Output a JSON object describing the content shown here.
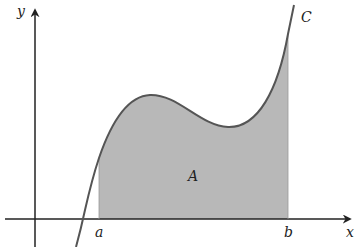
{
  "diagram": {
    "labels": {
      "y_axis": "y",
      "x_axis": "x",
      "curve": "C",
      "area": "A",
      "lower_bound": "a",
      "upper_bound": "b"
    },
    "colors": {
      "fill": "#b8b8b8",
      "curve": "#555555",
      "axis": "#222222"
    }
  }
}
